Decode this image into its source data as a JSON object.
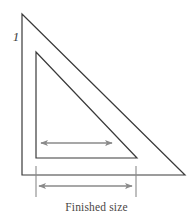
{
  "figure": {
    "kind": "line-drawing",
    "background_color": "#ffffff",
    "step_label": "1",
    "caption": "Finished size",
    "colors": {
      "outline_stroke": "#3a3a3a",
      "dimension_stroke": "#8a8a8a",
      "extension_stroke": "#8a8a8a",
      "step_label_color": "#3b3b3b",
      "caption_color": "#4a4645"
    },
    "outer_triangle": {
      "name": "outer-triangle",
      "apex": [
        22,
        14
      ],
      "bottom_left": [
        22,
        175
      ],
      "bottom_right": [
        185,
        175
      ],
      "stroke_width": 1.2
    },
    "inner_triangle": {
      "name": "inner-triangle",
      "apex": [
        36,
        52
      ],
      "bottom_left": [
        36,
        158
      ],
      "bottom_right": [
        137,
        158
      ],
      "stroke_width": 1.2
    },
    "inner_arrow": {
      "name": "inner-dimension-arrow",
      "x1": 41,
      "x2": 112,
      "y": 143,
      "stroke_width": 1.3,
      "double_headed": true
    },
    "outer_arrow": {
      "name": "finished-size-dimension-arrow",
      "x1": 39,
      "x2": 132,
      "y": 186,
      "stroke_width": 1.3,
      "double_headed": true
    },
    "extension_lines": [
      {
        "name": "left-extension-line",
        "x": 36,
        "y1": 166,
        "y2": 197
      },
      {
        "name": "right-extension-line",
        "x": 136,
        "y1": 166,
        "y2": 197
      }
    ]
  }
}
